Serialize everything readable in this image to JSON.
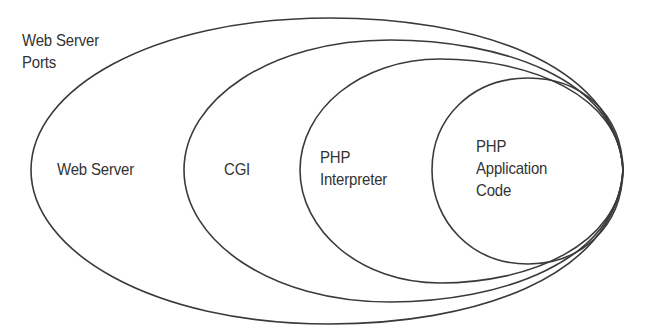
{
  "diagram": {
    "type": "nested-layers",
    "outer_caption": {
      "lines": [
        "Web Server",
        "Ports"
      ]
    },
    "layers": [
      {
        "id": "web-server",
        "lines": [
          "Web Server"
        ]
      },
      {
        "id": "cgi",
        "lines": [
          "CGI"
        ]
      },
      {
        "id": "php-interpreter",
        "lines": [
          "PHP",
          "Interpreter"
        ]
      },
      {
        "id": "php-application-code",
        "lines": [
          "PHP",
          "Application",
          "Code"
        ]
      }
    ],
    "colors": {
      "stroke": "#3a3a3a",
      "text": "#333333",
      "background": "#ffffff"
    }
  }
}
